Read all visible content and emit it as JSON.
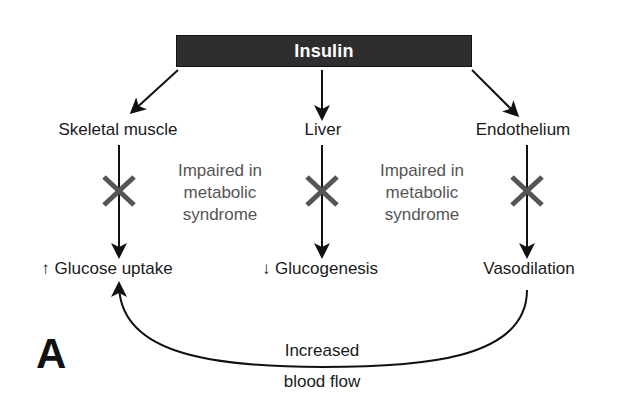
{
  "header": {
    "title": "Insulin"
  },
  "targets": [
    {
      "label": "Skeletal muscle",
      "effect": "Glucose uptake",
      "effect_direction": "increase",
      "effect_arrow": "↑"
    },
    {
      "label": "Liver",
      "effect": "Glucogenesis",
      "effect_direction": "decrease",
      "effect_arrow": "↓"
    },
    {
      "label": "Endothelium",
      "effect": "Vasodilation",
      "effect_direction": "none",
      "effect_arrow": ""
    }
  ],
  "impairment_notes": [
    {
      "line1": "Impaired in",
      "line2": "metabolic",
      "line3": "syndrome"
    },
    {
      "line1": "Impaired in",
      "line2": "metabolic",
      "line3": "syndrome"
    }
  ],
  "feedback": {
    "line1": "Increased",
    "line2": "blood flow"
  },
  "panel_label": "A",
  "colors": {
    "bar": "#2e2e2e",
    "bar_text": "#ffffff",
    "cross": "#555555",
    "impaired_text": "#555555",
    "lines": "#111111"
  }
}
